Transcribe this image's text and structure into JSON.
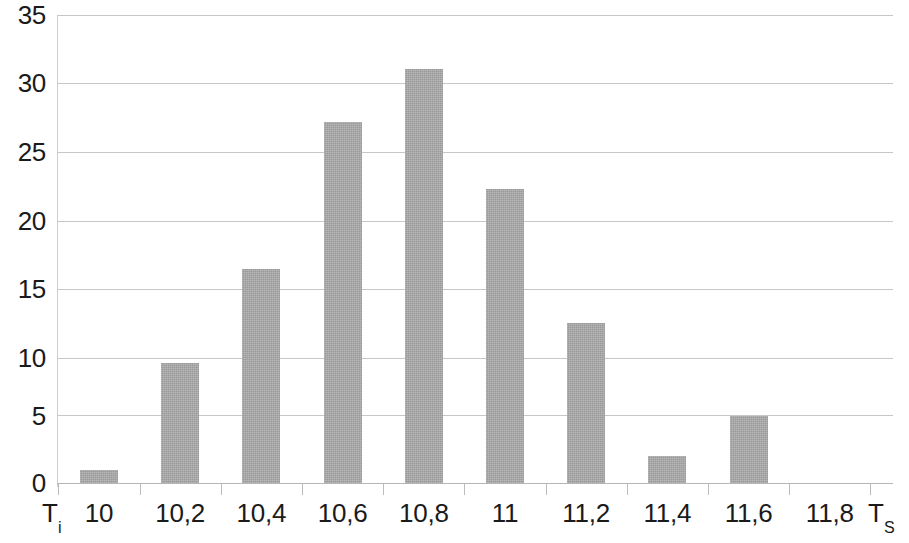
{
  "chart_data": {
    "type": "bar",
    "title": "",
    "subtitle": "",
    "xlabel": "",
    "ylabel": "",
    "categories": [
      "10",
      "10,2",
      "10,4",
      "10,6",
      "10,8",
      "11",
      "11,2",
      "11,4",
      "11,6",
      "11,8"
    ],
    "values": [
      1,
      9,
      16,
      27,
      31,
      22,
      12,
      2,
      5,
      0
    ],
    "series": [
      {
        "name": "",
        "values": [
          1,
          9,
          16,
          27,
          31,
          22,
          12,
          2,
          5,
          0
        ]
      }
    ],
    "ylim": [
      0,
      35
    ],
    "yticks": [
      "0",
      "5",
      "10",
      "15",
      "20",
      "25",
      "30",
      "35"
    ],
    "ytick_values": [
      0,
      5,
      10,
      15,
      20,
      25,
      30,
      35
    ],
    "grid": "horizontal",
    "legend": "none",
    "bar_color": "#a6a6a6",
    "grid_color": "#c7c7c7",
    "text_color": "#1a1a1a",
    "axis_start_label": "T",
    "axis_start_label_sub": "i",
    "axis_end_label": "T",
    "axis_end_label_sub": "S",
    "annotations": []
  }
}
